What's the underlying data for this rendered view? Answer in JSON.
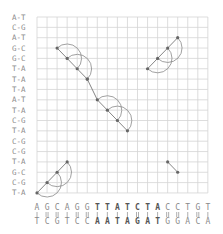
{
  "diagram": {
    "type": "dot-plot",
    "grid": {
      "left": 37,
      "top": 17,
      "cell_w": 10.05,
      "cell_h": 10.35,
      "cols": 18,
      "rows": 18
    },
    "y_labels": [
      "A-T",
      "C-G",
      "A-T",
      "G-C",
      "G-C",
      "T-A",
      "T-A",
      "T-A",
      "A-T",
      "T-A",
      "C-G",
      "T-A",
      "C-G",
      "C-G",
      "T-A",
      "G-C",
      "C-G",
      "T-A"
    ],
    "x_top": [
      "A",
      "G",
      "C",
      "A",
      "G",
      "G",
      "T",
      "T",
      "A",
      "T",
      "C",
      "T",
      "A",
      "C",
      "C",
      "T",
      "G",
      "T"
    ],
    "x_bottom": [
      "T",
      "C",
      "G",
      "T",
      "C",
      "C",
      "A",
      "A",
      "T",
      "A",
      "G",
      "A",
      "T",
      "G",
      "G",
      "A",
      "C",
      "A"
    ],
    "x_bold": [
      6,
      7,
      8,
      9,
      10,
      11,
      12
    ],
    "x_bond_strength": [
      2,
      3,
      3,
      2,
      3,
      3,
      2,
      2,
      2,
      2,
      3,
      2,
      2,
      3,
      3,
      2,
      3,
      2
    ],
    "chains": [
      {
        "name": "chain-top-left",
        "nodes": [
          [
            2,
            3
          ],
          [
            3,
            4
          ],
          [
            4,
            5
          ],
          [
            5,
            6
          ]
        ],
        "arcs": [
          [
            0,
            2,
            "ur"
          ],
          [
            1,
            3,
            "ur"
          ]
        ]
      },
      {
        "name": "chain-middle",
        "nodes": [
          [
            5,
            6
          ],
          [
            6,
            8
          ],
          [
            7,
            9
          ],
          [
            8,
            10
          ],
          [
            9,
            11
          ]
        ],
        "arcs": [
          [
            1,
            3,
            "ur"
          ],
          [
            2,
            4,
            "ur"
          ]
        ]
      },
      {
        "name": "chain-top-right",
        "nodes": [
          [
            11,
            5
          ],
          [
            12,
            4
          ],
          [
            13,
            3
          ],
          [
            14,
            2
          ]
        ],
        "arcs": [
          [
            0,
            2,
            "ul"
          ],
          [
            1,
            3,
            "ul"
          ]
        ]
      },
      {
        "name": "chain-bottom-left",
        "nodes": [
          [
            0,
            17
          ],
          [
            1,
            16
          ],
          [
            2,
            15
          ],
          [
            3,
            14
          ]
        ],
        "arcs": [
          [
            0,
            2,
            "ul"
          ],
          [
            1,
            3,
            "ul"
          ]
        ]
      },
      {
        "name": "chain-bottom-right",
        "nodes": [
          [
            13,
            14
          ],
          [
            14,
            15
          ]
        ],
        "arcs": []
      }
    ]
  }
}
